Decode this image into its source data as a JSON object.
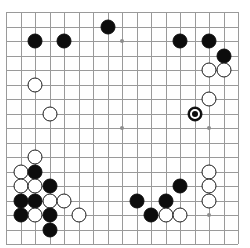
{
  "app": {
    "title": "Go Board",
    "board_label": "go-goban"
  },
  "board": {
    "type": "go-board",
    "columns": 17,
    "rows": 17,
    "origin_x": 6,
    "origin_y": 12,
    "spacing": 14.5,
    "line_color": "#9a9a9a",
    "background_color": "#ffffff",
    "black_color": "#0d0d0d",
    "white_color": "#ffffff",
    "stone_radius": 7.5,
    "hoshi": [
      {
        "c": 8,
        "r": 2
      },
      {
        "c": 2,
        "r": 2
      },
      {
        "c": 8,
        "r": 8
      },
      {
        "c": 14,
        "r": 8
      },
      {
        "c": 2,
        "r": 14
      },
      {
        "c": 14,
        "r": 14
      }
    ],
    "stones": [
      {
        "c": 2,
        "r": 2,
        "color": "black"
      },
      {
        "c": 4,
        "r": 2,
        "color": "black"
      },
      {
        "c": 7,
        "r": 1,
        "color": "black"
      },
      {
        "c": 12,
        "r": 2,
        "color": "black"
      },
      {
        "c": 14,
        "r": 2,
        "color": "black"
      },
      {
        "c": 15,
        "r": 3,
        "color": "black"
      },
      {
        "c": 14,
        "r": 4,
        "color": "white"
      },
      {
        "c": 15,
        "r": 4,
        "color": "white"
      },
      {
        "c": 2,
        "r": 5,
        "color": "white"
      },
      {
        "c": 14,
        "r": 6,
        "color": "white"
      },
      {
        "c": 3,
        "r": 7,
        "color": "white"
      },
      {
        "c": 13,
        "r": 7,
        "color": "black",
        "marked": true
      },
      {
        "c": 2,
        "r": 10,
        "color": "white"
      },
      {
        "c": 1,
        "r": 11,
        "color": "white"
      },
      {
        "c": 2,
        "r": 11,
        "color": "black"
      },
      {
        "c": 1,
        "r": 12,
        "color": "white"
      },
      {
        "c": 2,
        "r": 12,
        "color": "white"
      },
      {
        "c": 3,
        "r": 12,
        "color": "black"
      },
      {
        "c": 1,
        "r": 13,
        "color": "black"
      },
      {
        "c": 2,
        "r": 13,
        "color": "black"
      },
      {
        "c": 3,
        "r": 13,
        "color": "white"
      },
      {
        "c": 4,
        "r": 13,
        "color": "white"
      },
      {
        "c": 1,
        "r": 14,
        "color": "black"
      },
      {
        "c": 2,
        "r": 14,
        "color": "white"
      },
      {
        "c": 3,
        "r": 14,
        "color": "black"
      },
      {
        "c": 5,
        "r": 14,
        "color": "white"
      },
      {
        "c": 3,
        "r": 15,
        "color": "black"
      },
      {
        "c": 9,
        "r": 13,
        "color": "black"
      },
      {
        "c": 11,
        "r": 13,
        "color": "black"
      },
      {
        "c": 12,
        "r": 12,
        "color": "black"
      },
      {
        "c": 10,
        "r": 14,
        "color": "black"
      },
      {
        "c": 11,
        "r": 14,
        "color": "white"
      },
      {
        "c": 12,
        "r": 14,
        "color": "white"
      },
      {
        "c": 14,
        "r": 11,
        "color": "white"
      },
      {
        "c": 14,
        "r": 12,
        "color": "white"
      },
      {
        "c": 14,
        "r": 13,
        "color": "white"
      }
    ]
  }
}
